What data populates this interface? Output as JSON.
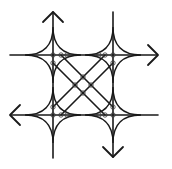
{
  "diagram": {
    "title": "",
    "colors": {
      "stroke": "#1a1a1a",
      "background": "#ffffff",
      "node": "#333333"
    },
    "horizontal_lines": [
      {
        "name": "top-road",
        "y": 55,
        "x1": 10,
        "x2": 157
      },
      {
        "name": "bottom-road",
        "y": 115,
        "x1": 11,
        "x2": 158
      }
    ],
    "vertical_lines": [
      {
        "name": "left-road",
        "x": 53,
        "y1": 12,
        "y2": 158
      },
      {
        "name": "right-road",
        "x": 113,
        "y1": 12,
        "y2": 157
      }
    ],
    "diagonals": [
      {
        "name": "diag-a1",
        "x1": 53,
        "y1": 63,
        "x2": 105,
        "y2": 115
      },
      {
        "name": "diag-a2",
        "x1": 61,
        "y1": 55,
        "x2": 113,
        "y2": 107
      },
      {
        "name": "diag-b1",
        "x1": 105,
        "y1": 55,
        "x2": 53,
        "y2": 107
      },
      {
        "name": "diag-b2",
        "x1": 113,
        "y1": 63,
        "x2": 61,
        "y2": 115
      }
    ],
    "corner_cusps": [
      {
        "name": "cusp-top-left",
        "cx": 53,
        "cy": 55,
        "r": 28
      },
      {
        "name": "cusp-top-right",
        "cx": 113,
        "cy": 55,
        "r": 28
      },
      {
        "name": "cusp-bottom-left",
        "cx": 53,
        "cy": 115,
        "r": 28
      },
      {
        "name": "cusp-bottom-right",
        "cx": 113,
        "cy": 115,
        "r": 28
      }
    ],
    "arrows": [
      {
        "name": "arrow-up",
        "direction": "up",
        "tip": [
          53,
          12
        ],
        "arm1": [
          43,
          22
        ],
        "arm2": [
          63,
          22
        ]
      },
      {
        "name": "arrow-right",
        "direction": "right",
        "tip": [
          158,
          55
        ],
        "arm1": [
          148,
          45
        ],
        "arm2": [
          148,
          65
        ]
      },
      {
        "name": "arrow-left",
        "direction": "left",
        "tip": [
          10,
          115
        ],
        "arm1": [
          20,
          105
        ],
        "arm2": [
          20,
          125
        ]
      },
      {
        "name": "arrow-down",
        "direction": "down",
        "tip": [
          113,
          157
        ],
        "arm1": [
          103,
          147
        ],
        "arm2": [
          123,
          147
        ]
      }
    ],
    "nodes": [
      [
        53,
        55
      ],
      [
        61,
        55
      ],
      [
        67,
        55
      ],
      [
        105,
        55
      ],
      [
        99,
        55
      ],
      [
        113,
        55
      ],
      [
        53,
        63
      ],
      [
        113,
        63
      ],
      [
        53,
        107
      ],
      [
        113,
        107
      ],
      [
        53,
        115
      ],
      [
        61,
        115
      ],
      [
        67,
        115
      ],
      [
        99,
        115
      ],
      [
        105,
        115
      ],
      [
        113,
        115
      ],
      [
        75,
        85
      ],
      [
        91,
        85
      ],
      [
        83,
        77
      ],
      [
        83,
        93
      ]
    ],
    "node_radius": 2.2
  }
}
